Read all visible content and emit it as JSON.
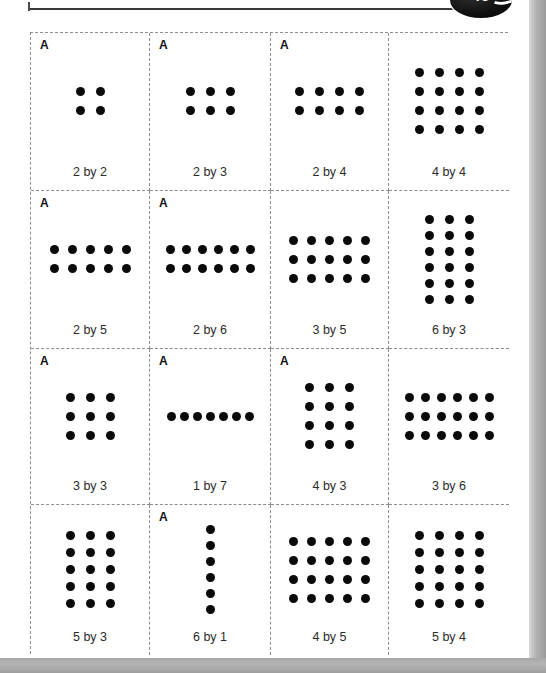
{
  "header": {
    "page_badge_number": "45",
    "rule_present": true
  },
  "grid": {
    "marker_label": "A",
    "columns": 4,
    "rows": 4,
    "cells": [
      {
        "label": "2 by 2",
        "rows": 2,
        "cols": 2,
        "marker": "A",
        "has_marker": true
      },
      {
        "label": "2 by 3",
        "rows": 2,
        "cols": 3,
        "marker": "A",
        "has_marker": true
      },
      {
        "label": "2 by 4",
        "rows": 2,
        "cols": 4,
        "marker": "A",
        "has_marker": true
      },
      {
        "label": "4 by 4",
        "rows": 4,
        "cols": 4,
        "marker": "",
        "has_marker": false
      },
      {
        "label": "2 by 5",
        "rows": 2,
        "cols": 5,
        "marker": "A",
        "has_marker": true
      },
      {
        "label": "2 by 6",
        "rows": 2,
        "cols": 6,
        "marker": "A",
        "has_marker": true
      },
      {
        "label": "3 by 5",
        "rows": 3,
        "cols": 5,
        "marker": "",
        "has_marker": false
      },
      {
        "label": "6 by 3",
        "rows": 6,
        "cols": 3,
        "marker": "",
        "has_marker": false
      },
      {
        "label": "3 by 3",
        "rows": 3,
        "cols": 3,
        "marker": "A",
        "has_marker": true
      },
      {
        "label": "1 by 7",
        "rows": 1,
        "cols": 7,
        "marker": "A",
        "has_marker": true
      },
      {
        "label": "4 by 3",
        "rows": 4,
        "cols": 3,
        "marker": "A",
        "has_marker": true
      },
      {
        "label": "3 by 6",
        "rows": 3,
        "cols": 6,
        "marker": "",
        "has_marker": false
      },
      {
        "label": "5 by 3",
        "rows": 5,
        "cols": 3,
        "marker": "",
        "has_marker": false
      },
      {
        "label": "6 by 1",
        "rows": 6,
        "cols": 1,
        "marker": "A",
        "has_marker": true
      },
      {
        "label": "4 by 5",
        "rows": 4,
        "cols": 5,
        "marker": "",
        "has_marker": false
      },
      {
        "label": "5 by 4",
        "rows": 5,
        "cols": 4,
        "marker": "",
        "has_marker": false
      }
    ]
  },
  "colors": {
    "dot": "#0a0a0a",
    "cell_border": "#8d8d8d",
    "label_text": "#2b2b2b",
    "marker_text": "#111111",
    "page_background": "#ffffff",
    "chrome_band": "#b0b0b0"
  }
}
